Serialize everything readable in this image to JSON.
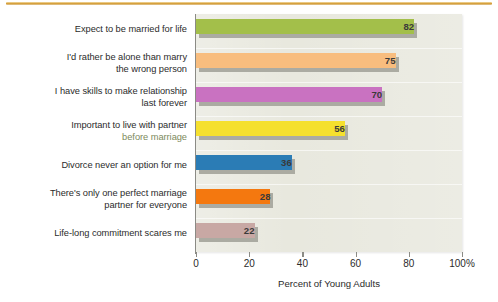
{
  "figure": {
    "accent_rule_color": "#d9a441",
    "plot_background": "#e8e8de"
  },
  "chart_data": {
    "type": "bar",
    "orientation": "horizontal",
    "title": "",
    "xlabel": "Percent of Young Adults",
    "ylabel": "",
    "xlim": [
      0,
      100
    ],
    "grid": true,
    "legend": null,
    "xticks": [
      0,
      20,
      40,
      60,
      80,
      100
    ],
    "xtick_labels": [
      "0",
      "20",
      "40",
      "60",
      "80",
      "100%"
    ],
    "categories": [
      "Expect to be married for life",
      "I'd rather be alone than marry the wrong person",
      "I have skills to make relationship last forever",
      "Important to live with partner before marriage",
      "Divorce never an option for me",
      "There's only one perfect marriage partner for everyone",
      "Life-long commitment scares me"
    ],
    "values": [
      82,
      75,
      70,
      56,
      36,
      28,
      22
    ],
    "value_labels": [
      "82",
      "75",
      "70",
      "56",
      "36",
      "28",
      "22"
    ],
    "bar_colors": [
      "#a3bf4a",
      "#f8bd7e",
      "#c972c1",
      "#f5e02e",
      "#2b7cb5",
      "#f4780f",
      "#c8a8a4"
    ]
  },
  "labels": [
    {
      "line1": "Expect to be married for life",
      "line2": "",
      "line2_highlight": false
    },
    {
      "line1": "I'd rather be alone than marry",
      "line2": "the wrong person",
      "line2_highlight": false
    },
    {
      "line1": "I have skills to make relationship",
      "line2": "last forever",
      "line2_highlight": false
    },
    {
      "line1": "Important to live with partner",
      "line2": "before marriage",
      "line2_highlight": true
    },
    {
      "line1": "Divorce never an option for me",
      "line2": "",
      "line2_highlight": false
    },
    {
      "line1": "There's only one perfect marriage",
      "line2": "partner for everyone",
      "line2_highlight": false
    },
    {
      "line1": "Life-long commitment scares me",
      "line2": "",
      "line2_highlight": false
    }
  ]
}
